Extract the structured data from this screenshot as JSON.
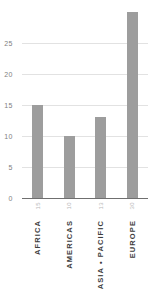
{
  "chart_data": {
    "type": "bar",
    "title": "",
    "subtitle": "",
    "xlabel": "",
    "ylabel": "",
    "categories": [
      "AFRICA",
      "AMERICAS",
      "ASIA • PACIFIC",
      "EUROPE"
    ],
    "values": [
      15,
      10,
      13,
      30
    ],
    "value_labels": [
      "15",
      "10",
      "13",
      "30"
    ],
    "ylim": [
      0,
      30
    ],
    "yticks": [
      0,
      5,
      10,
      15,
      20,
      25
    ],
    "ytick_labels": [
      "0",
      "5",
      "10",
      "15",
      "20",
      "25"
    ],
    "grid": true,
    "grid_axis": "y",
    "legend": false,
    "legend_position": "none",
    "orientation": "vertical",
    "bar_color": "#9d9d9d",
    "gridline_color": "#e2e2e2",
    "axis_color": "#6f6f6f",
    "tick_label_color": "#808080",
    "category_label_color": "#3d3d3d",
    "value_label_color": "#b9b9b9",
    "background_color": "#ffffff"
  }
}
